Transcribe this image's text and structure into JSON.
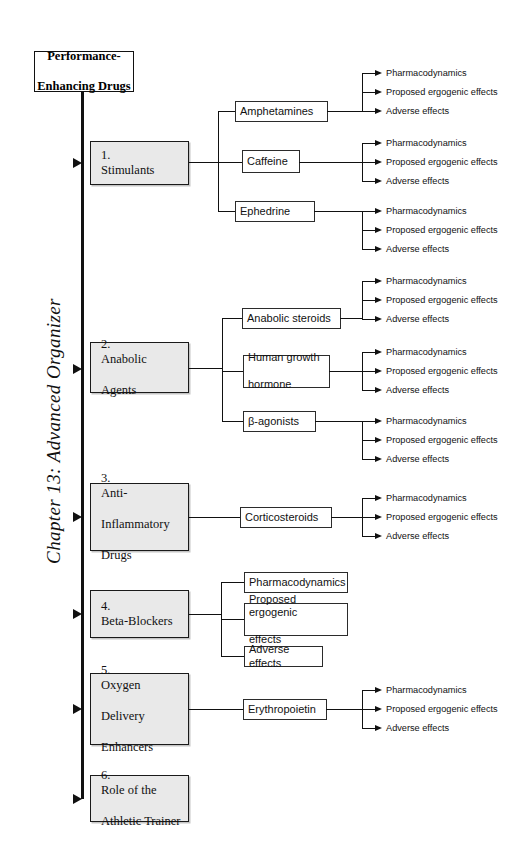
{
  "chapter_title": "Chapter 13: Advanced Organizer",
  "root": {
    "line1": "Performance-",
    "line2": "Enhancing Drugs"
  },
  "leaf_labels": {
    "pharmacodynamics": "Pharmacodynamics",
    "proposed": "Proposed ergogenic effects",
    "adverse": "Adverse effects"
  },
  "categories": [
    {
      "number": "1.",
      "label": "Stimulants",
      "children": [
        {
          "label": "Amphetamines"
        },
        {
          "label": "Caffeine"
        },
        {
          "label": "Ephedrine"
        }
      ]
    },
    {
      "number": "2.",
      "label_line1": "Anabolic",
      "label_line2": "Agents",
      "children": [
        {
          "label": "Anabolic steroids"
        },
        {
          "label_line1": "Human growth",
          "label_line2": "hormone"
        },
        {
          "label": "β-agonists"
        }
      ]
    },
    {
      "number": "3.",
      "label_line1": "Anti-",
      "label_line2": "Inflammatory",
      "label_line3": "Drugs",
      "children": [
        {
          "label": "Corticosteroids"
        }
      ]
    },
    {
      "number": "4.",
      "label": "Beta-Blockers",
      "children": [
        {
          "label": "Pharmacodynamics"
        },
        {
          "label_line1": "Proposed ergogenic",
          "label_line2": "effects"
        },
        {
          "label": "Adverse effects"
        }
      ]
    },
    {
      "number": "5.",
      "label_line1": "Oxygen",
      "label_line2": "Delivery",
      "label_line3": "Enhancers",
      "children": [
        {
          "label": "Erythropoietin"
        }
      ]
    },
    {
      "number": "6.",
      "label_line1": "Role of the",
      "label_line2": "Athletic Trainer",
      "children": []
    }
  ]
}
